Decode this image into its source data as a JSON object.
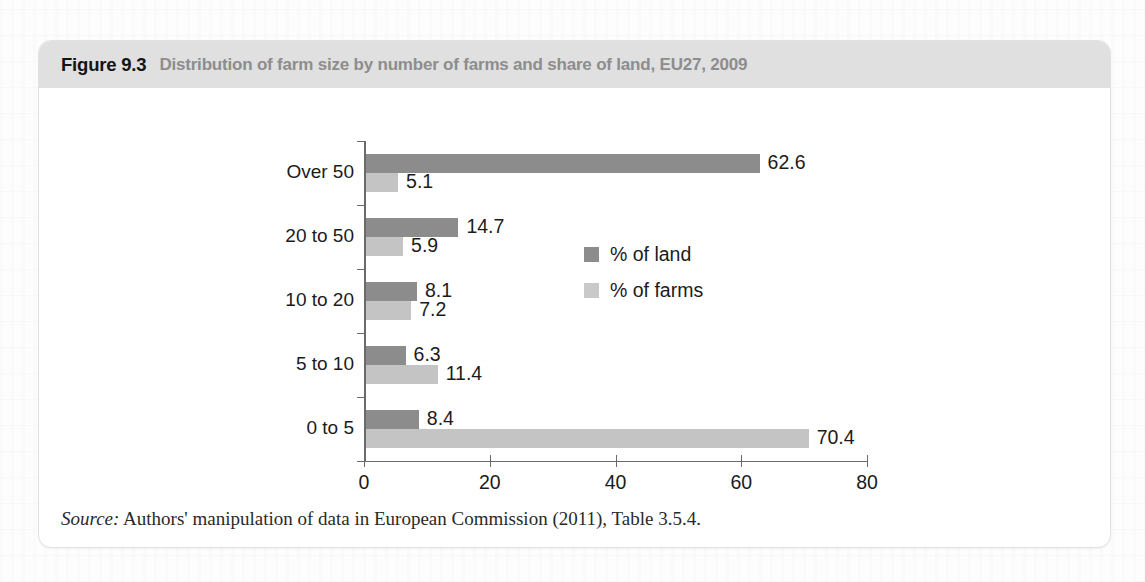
{
  "figure": {
    "number": "Figure 9.3",
    "caption": "Distribution of farm size by number of farms and share of land, EU27, 2009",
    "source_label": "Source:",
    "source_text": "Authors' manipulation of data in European Commission (2011), Table 3.5.4."
  },
  "colors": {
    "land": "#8c8c8c",
    "farms": "#c4c4c4",
    "header_band": "#e0e0e0",
    "axis": "#6a6a6a",
    "text": "#1b1b1b",
    "caption": "#8d8d8d"
  },
  "chart_data": {
    "type": "bar",
    "orientation": "horizontal",
    "title": "Distribution of farm size by number of farms and share of land, EU27, 2009",
    "xlabel": "",
    "ylabel": "",
    "categories": [
      "0 to 5",
      "5 to 10",
      "10 to 20",
      "20 to 50",
      "Over 50"
    ],
    "series": [
      {
        "name": "% of land",
        "color": "#8c8c8c",
        "values": [
          8.4,
          6.3,
          8.1,
          14.7,
          62.6
        ]
      },
      {
        "name": "% of farms",
        "color": "#c4c4c4",
        "values": [
          70.4,
          11.4,
          7.2,
          5.9,
          5.1
        ]
      }
    ],
    "xlim": [
      0,
      80
    ],
    "xticks": [
      0,
      20,
      40,
      60,
      80
    ],
    "xtick_labels": [
      "0",
      "20",
      "40",
      "60",
      "80"
    ],
    "grid": false,
    "legend_position": "center",
    "data_labels": {
      "land": [
        "8.4",
        "6.3",
        "8.1",
        "14.7",
        "62.6"
      ],
      "farms": [
        "70.4",
        "11.4",
        "7.2",
        "5.9",
        "5.1"
      ]
    }
  }
}
